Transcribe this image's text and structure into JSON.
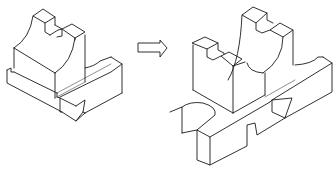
{
  "diagram": {
    "type": "isometric-line-drawing",
    "panels": [
      {
        "id": "original-part",
        "label": ""
      },
      {
        "id": "transform-arrow",
        "direction": "right",
        "label": ""
      },
      {
        "id": "result-assembly",
        "label": ""
      }
    ],
    "colors": {
      "line": "#1a1a1a",
      "background": "#ffffff"
    }
  }
}
